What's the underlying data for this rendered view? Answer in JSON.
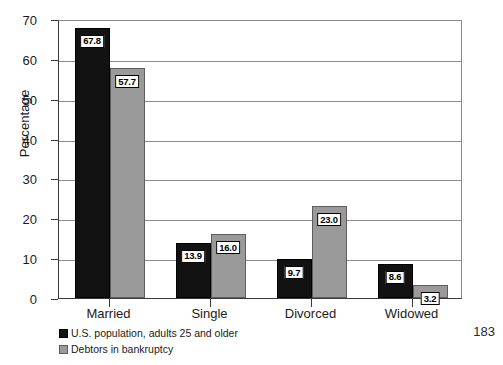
{
  "page": {
    "page_number": "183"
  },
  "chart_data": {
    "type": "bar",
    "title": "",
    "subtitle": "",
    "xlabel": "",
    "ylabel": "Percentage",
    "ylim": [
      0,
      70
    ],
    "ytick_step": 10,
    "yticks": [
      "0",
      "10",
      "20",
      "30",
      "40",
      "50",
      "60",
      "70"
    ],
    "grid": true,
    "legend_position": "below-left",
    "categories": [
      "Married",
      "Single",
      "Divorced",
      "Widowed"
    ],
    "series": [
      {
        "name": "U.S. population, adults 25 and older",
        "color": "#121212",
        "values": [
          67.8,
          13.9,
          9.7,
          8.6
        ],
        "labels": [
          "67.8",
          "13.9",
          "9.7",
          "8.6"
        ]
      },
      {
        "name": "Debtors in bankruptcy",
        "color": "#9a9a9a",
        "values": [
          57.7,
          16.0,
          23.0,
          3.2
        ],
        "labels": [
          "57.7",
          "16.0",
          "23.0",
          "3.2"
        ]
      }
    ]
  }
}
